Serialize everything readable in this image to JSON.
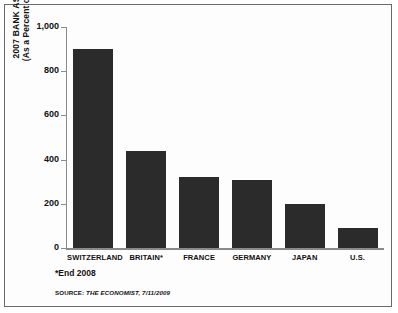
{
  "chart_data": {
    "type": "bar",
    "title": "",
    "categories": [
      "SWITZERLAND",
      "BRITAIN*",
      "FRANCE",
      "GERMANY",
      "JAPAN",
      "U.S."
    ],
    "values": [
      900,
      440,
      320,
      310,
      200,
      90
    ],
    "xlabel": "",
    "ylabel": "2007 BANK ASSETS (As a Percent of GDP)",
    "ylabel_line1": "2007 BANK ASSETS",
    "ylabel_line2": "(As a Percent of GDP)",
    "ylim": [
      0,
      1000
    ],
    "yticks": [
      0,
      200,
      400,
      600,
      800,
      1000
    ],
    "ytick_labels": [
      "0",
      "200",
      "400",
      "600",
      "800",
      "1,000"
    ],
    "grid": false,
    "legend": null,
    "bar_color": "#2b2b2b",
    "axis_color": "#8a8a8a",
    "background": "#fdfdfd"
  },
  "notes": {
    "footnote": "*End 2008",
    "source_prefix": "SOURCE:",
    "source_text": "THE ECONOMIST, 7/11/2009"
  }
}
